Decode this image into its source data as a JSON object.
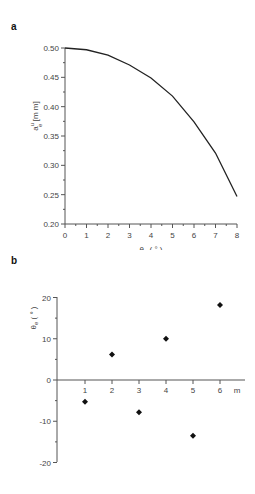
{
  "panels": [
    {
      "label": "a"
    },
    {
      "label": "b"
    }
  ],
  "chart_data": [
    {
      "type": "line",
      "panel": "a",
      "title": "",
      "xlabel": "θ0 (°)",
      "ylabel": "a_e^u [mm]",
      "xlim": [
        0,
        8
      ],
      "ylim": [
        0.2,
        0.5
      ],
      "xticks": [
        "0",
        "1",
        "2",
        "3",
        "4",
        "5",
        "6",
        "7",
        "8"
      ],
      "yticks": [
        "0.20",
        "0.25",
        "0.30",
        "0.35",
        "0.40",
        "0.45",
        "0.50"
      ],
      "grid": false,
      "x": [
        0,
        1,
        2,
        3,
        4,
        5,
        6,
        7,
        8
      ],
      "series": [
        {
          "name": "a_e^u",
          "values": [
            0.5,
            0.497,
            0.488,
            0.471,
            0.449,
            0.418,
            0.374,
            0.321,
            0.247
          ]
        }
      ]
    },
    {
      "type": "scatter",
      "panel": "b",
      "title": "",
      "xlabel": "m",
      "ylabel": "θe (°)",
      "xlim": [
        0,
        6.3
      ],
      "ylim": [
        -20,
        20
      ],
      "xticks": [
        "1",
        "2",
        "3",
        "4",
        "5",
        "6"
      ],
      "yticks": [
        "-20",
        "-10",
        "0",
        "10",
        "20"
      ],
      "grid": false,
      "x": [
        1,
        2,
        3,
        4,
        5,
        6
      ],
      "series": [
        {
          "name": "θe",
          "values": [
            -5.3,
            6.2,
            -7.8,
            10.0,
            -13.5,
            18.2
          ]
        }
      ]
    }
  ]
}
